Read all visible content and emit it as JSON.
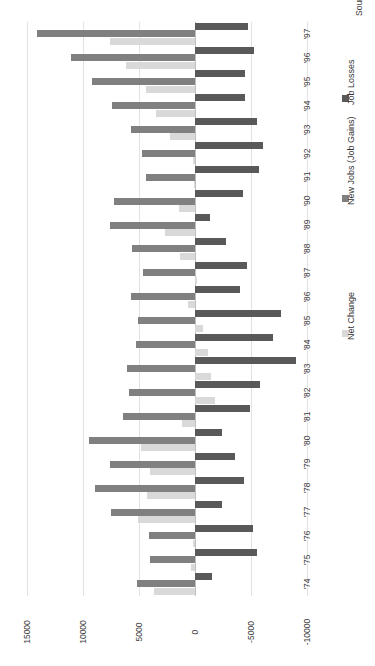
{
  "chart_data": {
    "type": "bar",
    "title": "",
    "subtitle": "",
    "orientation": "horizontal-rotated",
    "xlabel": "",
    "ylabel": "",
    "source_note": "Source: IDA-Ireland",
    "grid": true,
    "legend_position": "right",
    "value_axis": {
      "ticks": [
        15000,
        10000,
        5000,
        0,
        -5000,
        -10000
      ],
      "tick_labels": [
        "15000",
        "10000",
        "5000",
        "0",
        "-5000",
        "-10000"
      ],
      "min": -10000,
      "max": 15000
    },
    "categories": [
      "'74",
      "'75",
      "'76",
      "'77",
      "'78",
      "'79",
      "'80",
      "'81",
      "'82",
      "'83",
      "'84",
      "'85",
      "'86",
      "'87",
      "'88",
      "'89",
      "'90",
      "'91",
      "'92",
      "'93",
      "'94",
      "'95",
      "'96",
      "'97"
    ],
    "series": [
      {
        "name": "Net Change",
        "color": "#d9d9d9",
        "values": [
          3700,
          400,
          200,
          5100,
          4300,
          4000,
          4800,
          1200,
          -1800,
          -1400,
          -1200,
          -700,
          600,
          -200,
          1300,
          2700,
          1400,
          100,
          200,
          2200,
          3500,
          4400,
          6200,
          7600
        ]
      },
      {
        "name": "New Jobs (Job Gains)",
        "color": "#808080",
        "values": [
          5200,
          4000,
          4100,
          7500,
          8900,
          7600,
          9500,
          6400,
          5900,
          6100,
          5300,
          5100,
          5700,
          4600,
          5600,
          7600,
          7200,
          4400,
          4700,
          5700,
          7400,
          9200,
          11100,
          14100
        ]
      },
      {
        "name": "Job Losses",
        "color": "#595959",
        "values": [
          -1500,
          -5500,
          -5200,
          -2400,
          -4400,
          -3600,
          -2400,
          -4900,
          -5800,
          -9000,
          -7000,
          -7700,
          -4000,
          -4600,
          -2800,
          -1300,
          -4300,
          -5700,
          -6100,
          -5500,
          -4500,
          -4500,
          -5300,
          -4700
        ]
      }
    ]
  },
  "legend": {
    "items": [
      {
        "label": "Net Change",
        "color": "#d9d9d9"
      },
      {
        "label": "New Jobs (Job Gains)",
        "color": "#808080"
      },
      {
        "label": "Job Losses",
        "color": "#595959"
      }
    ]
  },
  "source": {
    "text": "Source: IDA-Ireland"
  }
}
